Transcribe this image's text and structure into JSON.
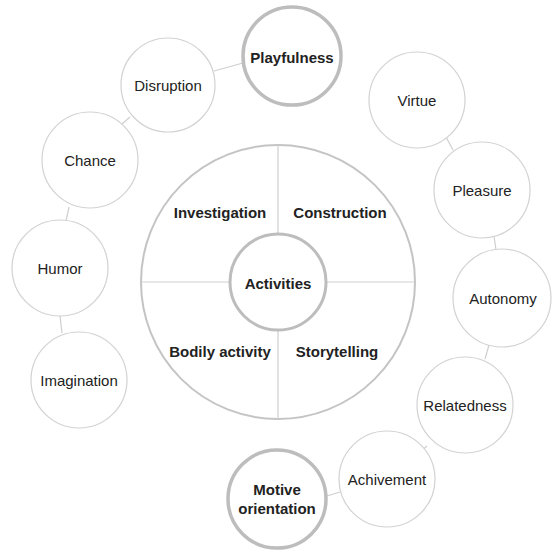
{
  "diagram": {
    "center": {
      "label": "Activities"
    },
    "quadrants": [
      {
        "label": "Investigation"
      },
      {
        "label": "Construction"
      },
      {
        "label": "Bodily activity"
      },
      {
        "label": "Storytelling"
      }
    ],
    "left_chain": {
      "head": "Playfulness",
      "items": [
        "Disruption",
        "Chance",
        "Humor",
        "Imagination"
      ]
    },
    "right_chain": {
      "head": "Motive orientation",
      "items": [
        "Virtue",
        "Pleasure",
        "Autonomy",
        "Relatedness",
        "Achivement"
      ]
    },
    "colors": {
      "stroke": "#c8c8c8",
      "stroke_bold": "#b4b4b4",
      "text": "#222222"
    }
  }
}
